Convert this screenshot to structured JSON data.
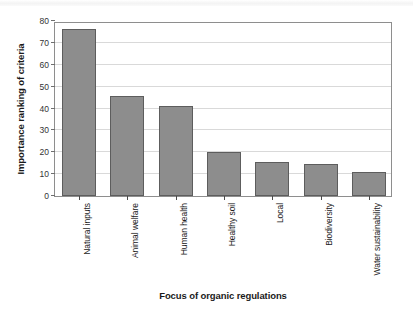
{
  "chart_data": {
    "type": "bar",
    "title": "",
    "xlabel": "Focus of organic regulations",
    "ylabel": "Importance ranking of criteria",
    "categories": [
      "Natural inputs",
      "Animal welfare",
      "Human health",
      "Healthy soil",
      "Local",
      "Biodiversity",
      "Water sustainability"
    ],
    "values": [
      76.5,
      45.5,
      41,
      20,
      15.5,
      14.5,
      11
    ],
    "ylim": [
      0,
      80
    ],
    "ytick_labels": [
      "0",
      "10",
      "20",
      "30",
      "40",
      "50",
      "60",
      "70",
      "80"
    ],
    "ytick_values": [
      0,
      10,
      20,
      30,
      40,
      50,
      60,
      70,
      80
    ],
    "grid": true,
    "legend": "none",
    "bar_color": "#8d8d8d",
    "bar_edge_color": "#5d5d5d",
    "gridline_color": "#d9d9d9",
    "frame_color": "#8e8e8e",
    "background_color": "#ffffff"
  }
}
